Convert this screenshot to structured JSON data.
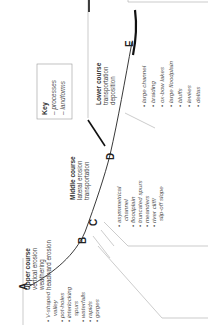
{
  "diagram": {
    "orientation": "rotated -90 degrees (text reads bottom to top)",
    "points": [
      "A",
      "B",
      "C",
      "D",
      "E"
    ],
    "key": {
      "title": "Key",
      "items": [
        "– processes",
        "– landforms"
      ]
    },
    "upper_course": {
      "title": "Upper course",
      "processes": [
        "vertical erosion",
        "weathering",
        "headward erosion"
      ],
      "landforms": [
        "V-shaped",
        "valley",
        "pot-holes",
        "interlocking",
        "spurs",
        "waterfalls",
        "rapids",
        "gorges"
      ]
    },
    "middle_course": {
      "title": "Middle course",
      "processes": [
        "lateral erosion",
        "transportation"
      ],
      "landforms": [
        "asymmetrical",
        "channel",
        "floodplain",
        "truncated spurs",
        "meanders",
        "river cliff/",
        "slip-off slope"
      ]
    },
    "lower_course": {
      "title": "Lower course",
      "processes": [
        "transportation",
        "deposition"
      ],
      "landforms": [
        "large channel",
        "braiding",
        "ox-bow lakes",
        "large floodplain",
        "bluffs",
        "levées",
        "deltas"
      ]
    },
    "colors": {
      "profile_line": "#222222",
      "thick_line": "#111111",
      "bracket_lines": "#9a9a9a",
      "text": "#444444"
    }
  }
}
